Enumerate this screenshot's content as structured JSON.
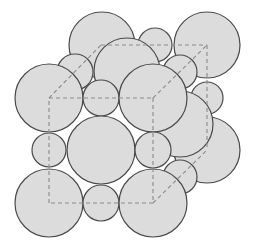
{
  "diagram": {
    "title": "",
    "colors": {
      "atom_fill": "#dcdcdc",
      "atom_stroke": "#4a4a4a",
      "edge": "#8a8a8a",
      "background": "#ffffff"
    },
    "cube": {
      "front": {
        "tl": [
          49,
          98
        ],
        "tr": [
          153,
          98
        ],
        "br": [
          153,
          203
        ],
        "bl": [
          49,
          203
        ]
      },
      "back": {
        "tl": [
          101,
          45
        ],
        "tr": [
          207,
          45
        ],
        "br": [
          207,
          150
        ],
        "bl": [
          101,
          150
        ]
      }
    },
    "atoms": [
      {
        "id": "back-top-left-corner",
        "cx": 102,
        "cy": 45,
        "r": 33
      },
      {
        "id": "back-top-edge",
        "cx": 155,
        "cy": 45,
        "r": 17
      },
      {
        "id": "back-top-right-corner",
        "cx": 207,
        "cy": 45,
        "r": 33
      },
      {
        "id": "back-right-edge",
        "cx": 207,
        "cy": 98,
        "r": 16
      },
      {
        "id": "back-bottom-right-corner",
        "cx": 207,
        "cy": 150,
        "r": 33
      },
      {
        "id": "right-face-center",
        "cx": 180,
        "cy": 124,
        "r": 33
      },
      {
        "id": "top-face-center",
        "cx": 127,
        "cy": 71,
        "r": 33
      },
      {
        "id": "left-top-edge",
        "cx": 75,
        "cy": 72,
        "r": 18
      },
      {
        "id": "right-top-edge",
        "cx": 180,
        "cy": 72,
        "r": 17
      },
      {
        "id": "right-bottom-edge",
        "cx": 180,
        "cy": 177,
        "r": 17
      },
      {
        "id": "front-top-left-corner",
        "cx": 49,
        "cy": 98,
        "r": 34
      },
      {
        "id": "front-top-edge",
        "cx": 101,
        "cy": 98,
        "r": 18
      },
      {
        "id": "front-top-right-corner",
        "cx": 153,
        "cy": 98,
        "r": 34
      },
      {
        "id": "front-left-edge",
        "cx": 49,
        "cy": 150,
        "r": 17
      },
      {
        "id": "front-face-center",
        "cx": 101,
        "cy": 150,
        "r": 34
      },
      {
        "id": "front-right-edge",
        "cx": 153,
        "cy": 150,
        "r": 18
      },
      {
        "id": "front-bottom-left-corner",
        "cx": 49,
        "cy": 203,
        "r": 34
      },
      {
        "id": "front-bottom-edge",
        "cx": 101,
        "cy": 203,
        "r": 18
      },
      {
        "id": "front-bottom-right-corner",
        "cx": 153,
        "cy": 203,
        "r": 34
      }
    ]
  }
}
